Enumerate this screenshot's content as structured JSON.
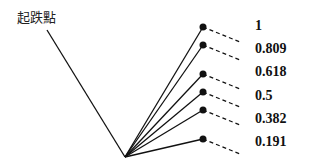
{
  "title": "起跌點",
  "origin": {
    "x": 47,
    "y": 30
  },
  "vertex": {
    "x": 125,
    "y": 157
  },
  "levels": [
    {
      "label": "1",
      "dot": {
        "x": 203,
        "y": 27
      },
      "dash_end": {
        "x": 240,
        "y": 42
      },
      "label_y": 18
    },
    {
      "label": "0.809",
      "dot": {
        "x": 203,
        "y": 45
      },
      "dash_end": {
        "x": 240,
        "y": 60
      },
      "label_y": 41
    },
    {
      "label": "0.618",
      "dot": {
        "x": 203,
        "y": 74
      },
      "dash_end": {
        "x": 240,
        "y": 89
      },
      "label_y": 64
    },
    {
      "label": "0.5",
      "dot": {
        "x": 203,
        "y": 92
      },
      "dash_end": {
        "x": 240,
        "y": 107
      },
      "label_y": 88
    },
    {
      "label": "0.382",
      "dot": {
        "x": 203,
        "y": 110
      },
      "dash_end": {
        "x": 240,
        "y": 125
      },
      "label_y": 111
    },
    {
      "label": "0.191",
      "dot": {
        "x": 203,
        "y": 139
      },
      "dash_end": {
        "x": 240,
        "y": 154
      },
      "label_y": 134
    }
  ],
  "colors": {
    "line": "#111111",
    "text": "#111111"
  }
}
